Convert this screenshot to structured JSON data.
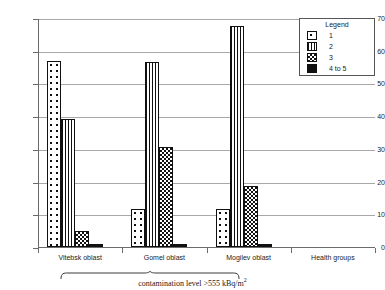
{
  "chart_data": {
    "type": "bar",
    "title": "",
    "xlabel": "",
    "ylabel": "",
    "ylim": [
      0,
      70
    ],
    "yticks": [
      0,
      10,
      20,
      30,
      40,
      50,
      60,
      70
    ],
    "grid": true,
    "legend_position": "top-right",
    "legend_title": "Legend",
    "categories": [
      "Vitebsk oblast",
      "Gomel oblast",
      "Mogilev oblast",
      "Health groups"
    ],
    "series": [
      {
        "name": "1",
        "pattern": "cross-hatch",
        "values": [
          57,
          11.5,
          11.5,
          null
        ]
      },
      {
        "name": "2",
        "pattern": "vertical-lines",
        "values": [
          39,
          56.5,
          67.5,
          null
        ]
      },
      {
        "name": "3",
        "pattern": "checkerboard",
        "values": [
          5,
          30.5,
          18.5,
          null
        ]
      },
      {
        "name": "4 to 5",
        "pattern": "solid-black",
        "values": [
          1,
          1,
          1,
          null
        ]
      }
    ],
    "annotation": "contamination level >555 kBq/m",
    "annotation_superscript": "2",
    "annotation_spans": [
      "Vitebsk oblast",
      "Gomel oblast",
      "Mogilev oblast"
    ]
  },
  "colors": {
    "axis": "#6b6b6b",
    "grid": "#a8a8a8",
    "bar_outline": "#111111",
    "solid_fill": "#111111",
    "background": "#ffffff"
  }
}
